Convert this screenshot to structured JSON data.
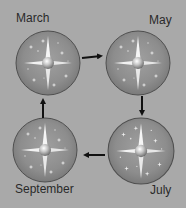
{
  "diagram": {
    "nodes": [
      {
        "id": "march",
        "label": "March",
        "cx": 48,
        "cy": 63,
        "r": 32,
        "label_x": 16,
        "label_y": 12
      },
      {
        "id": "may",
        "label": "May",
        "cx": 138,
        "cy": 63,
        "r": 32,
        "label_x": 150,
        "label_y": 14
      },
      {
        "id": "july",
        "label": "July",
        "cx": 141,
        "cy": 151,
        "r": 33,
        "label_x": 150,
        "label_y": 184
      },
      {
        "id": "september",
        "label": "September",
        "cx": 45,
        "cy": 150,
        "r": 32,
        "label_x": 16,
        "label_y": 182
      }
    ],
    "edges": [
      {
        "from": "march",
        "to": "may",
        "direction": "right"
      },
      {
        "from": "may",
        "to": "july",
        "direction": "down"
      },
      {
        "from": "july",
        "to": "september",
        "direction": "left"
      },
      {
        "from": "september",
        "to": "march",
        "direction": "up"
      }
    ],
    "colors": {
      "background": "#a9a9a9",
      "circle_fill": "#8e8e8e",
      "circle_stroke": "#555555",
      "star": "#f4f4f4",
      "arrow": "#111111",
      "text": "#2a2a2a"
    }
  }
}
